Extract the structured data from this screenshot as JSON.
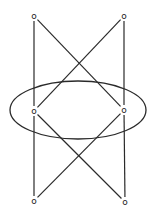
{
  "diagram": {
    "stroke_color": "#2a2a2a",
    "background": "#ffffff",
    "nodes": [
      {
        "id": "top-left",
        "label": "o",
        "x": 34,
        "y": 16
      },
      {
        "id": "top-right",
        "label": "o",
        "x": 124,
        "y": 16
      },
      {
        "id": "mid-left",
        "label": "o",
        "x": 34,
        "y": 111
      },
      {
        "id": "mid-right",
        "label": "o",
        "x": 124,
        "y": 110
      },
      {
        "id": "bottom-left",
        "label": "o",
        "x": 34,
        "y": 201
      },
      {
        "id": "bottom-right",
        "label": "o",
        "x": 125,
        "y": 202
      }
    ],
    "edges": [
      [
        "top-left",
        "mid-left"
      ],
      [
        "top-right",
        "mid-right"
      ],
      [
        "top-left",
        "mid-right"
      ],
      [
        "top-right",
        "mid-left"
      ],
      [
        "mid-left",
        "bottom-left"
      ],
      [
        "mid-right",
        "bottom-right"
      ],
      [
        "mid-left",
        "bottom-right"
      ],
      [
        "mid-right",
        "bottom-left"
      ]
    ],
    "ellipse": {
      "cx": 78,
      "cy": 110,
      "rx": 68,
      "ry": 29
    }
  }
}
